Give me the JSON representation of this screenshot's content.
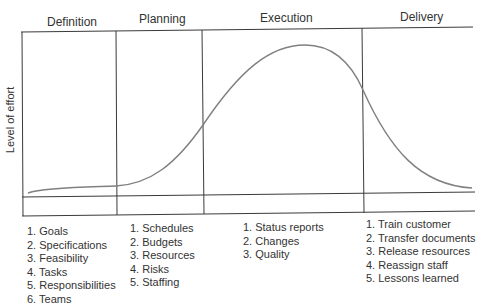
{
  "diagram": {
    "y_axis_label": "Level of effort",
    "line_color": "#3a3a3a",
    "curve_color": "#808080",
    "phases": [
      {
        "name": "Definition",
        "tasks": [
          "1. Goals",
          "2. Specifications",
          "3. Feasibility",
          "4. Tasks",
          "5. Responsibilities",
          "6. Teams"
        ]
      },
      {
        "name": "Planning",
        "tasks": [
          "1. Schedules",
          "2. Budgets",
          "3. Resources",
          "4. Risks",
          "5. Staffing"
        ]
      },
      {
        "name": "Execution",
        "tasks": [
          "1. Status reports",
          "2. Changes",
          "3. Quality"
        ]
      },
      {
        "name": "Delivery",
        "tasks": [
          "1. Train customer",
          "2. Transfer documents",
          "3. Release resources",
          "4. Reassign staff",
          "5. Lessons learned"
        ]
      }
    ]
  }
}
